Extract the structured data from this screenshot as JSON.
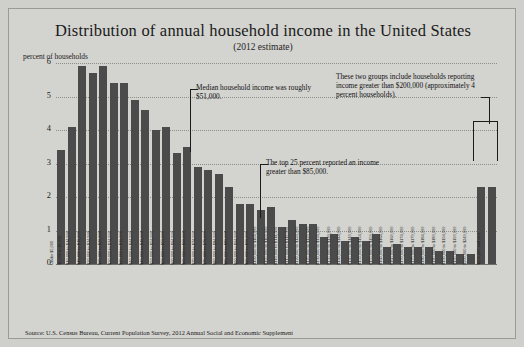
{
  "chart_data": {
    "type": "bar",
    "title": "Distribution of annual household income in the United States",
    "subtitle": "(2012 estimate)",
    "ylabel": "percent of households",
    "xlabel": "",
    "ylim": [
      0,
      6
    ],
    "yticks": [
      0,
      1,
      2,
      3,
      4,
      5,
      6
    ],
    "grid": true,
    "legend": "none",
    "source": "Source: U.S. Census Bureau, Current Population Survey, 2012 Annual Social and Economic Supplement",
    "categories": [
      "Under $5,000",
      "$5,000 to $9,999",
      "$10,000 to $14,999",
      "$15,000 to $19,999",
      "$20,000 to $24,999",
      "$25,000 to $29,999",
      "$30,000 to $34,999",
      "$35,000 to $39,999",
      "$40,000 to $44,999",
      "$45,000 to $49,999",
      "$50,000 to $54,999",
      "$55,000 to $59,999",
      "$60,000 to $64,999",
      "$65,000 to $69,999",
      "$70,000 to $74,999",
      "$75,000 to $79,999",
      "$80,000 to $84,999",
      "$85,000 to $89,999",
      "$90,000 to $94,999",
      "$95,000 to $99,999",
      "$100,000 to $104,999",
      "$105,000 to $109,999",
      "$110,000 to $114,999",
      "$115,000 to $119,999",
      "$120,000 to $124,999",
      "$125,000 to $129,999",
      "$130,000 to $134,999",
      "$135,000 to $139,999",
      "$140,000 to $144,999",
      "$145,000 to $149,999",
      "$150,000 to $154,999",
      "$155,000 to $159,999",
      "$160,000 to $164,999",
      "$165,000 to $169,999",
      "$170,000 to $174,999",
      "$175,000 to $179,999",
      "$180,000 to $184,999",
      "$185,000 to $189,999",
      "$190,000 to $194,999",
      "$195,000 to $199,999",
      "$200,000 to $249,999",
      "$250,000 and over"
    ],
    "values": [
      3.4,
      4.1,
      5.9,
      5.7,
      5.9,
      5.4,
      5.4,
      4.9,
      4.6,
      4.0,
      4.1,
      3.3,
      3.5,
      2.9,
      2.8,
      2.7,
      2.3,
      1.8,
      1.8,
      1.6,
      1.7,
      1.1,
      1.3,
      1.2,
      1.2,
      0.8,
      0.9,
      0.7,
      0.8,
      0.7,
      0.9,
      0.5,
      0.6,
      0.5,
      0.5,
      0.5,
      0.4,
      0.4,
      0.3,
      0.3,
      2.3,
      2.3
    ]
  },
  "annotations": {
    "median": "Median household income was roughly $51,000.",
    "top25": "The top 25 percent reported an income greater than $85,000.",
    "top_groups": "These two groups include households reporting income greater than $200,000 (approximately 4 percent households)."
  },
  "colors": {
    "bar": "#4b4b4b",
    "background": "#d3d3cf",
    "text": "#1a1a1a"
  }
}
